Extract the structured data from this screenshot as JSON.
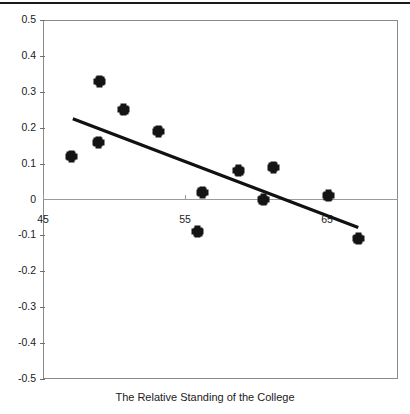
{
  "chart_data": {
    "type": "scatter",
    "title": "",
    "xlabel": "The Relative Standing of the College",
    "ylabel": "",
    "xlim": [
      45.0,
      70.0
    ],
    "ylim": [
      -0.5,
      0.5
    ],
    "grid": false,
    "legend": "none",
    "y_ticks": [
      "0.5",
      "0.4",
      "0.3",
      "0.2",
      "0.1",
      "0",
      "-0.1",
      "-0.2",
      "-0.3",
      "-0.4",
      "-0.5"
    ],
    "y_tick_values": [
      0.5,
      0.4,
      0.3,
      0.2,
      0.1,
      0,
      -0.1,
      -0.2,
      -0.3,
      -0.4,
      -0.5
    ],
    "x_ticks": [
      "45",
      "55",
      "65"
    ],
    "x_tick_values": [
      45,
      55,
      65
    ],
    "series": [
      {
        "name": "observations",
        "marker": "filled-square",
        "color": "#141414",
        "points": [
          {
            "x": 47.0,
            "y": 0.12
          },
          {
            "x": 48.9,
            "y": 0.16
          },
          {
            "x": 49.0,
            "y": 0.33
          },
          {
            "x": 50.7,
            "y": 0.25
          },
          {
            "x": 53.1,
            "y": 0.19
          },
          {
            "x": 55.9,
            "y": -0.09
          },
          {
            "x": 56.2,
            "y": 0.02
          },
          {
            "x": 58.8,
            "y": 0.08
          },
          {
            "x": 60.5,
            "y": 0.0
          },
          {
            "x": 61.2,
            "y": 0.09
          },
          {
            "x": 65.1,
            "y": 0.01
          },
          {
            "x": 67.2,
            "y": -0.11
          }
        ]
      },
      {
        "name": "trend-line",
        "type": "line",
        "color": "#111111",
        "points": [
          {
            "x": 47.1,
            "y": 0.225
          },
          {
            "x": 67.2,
            "y": -0.078
          }
        ]
      }
    ]
  },
  "figure": {
    "background_color": "#ffffff",
    "frame_color": "#8a8a8a",
    "axis_color": "#9a9a9a",
    "marker_color": "#141414",
    "trendline_color": "#111111"
  }
}
